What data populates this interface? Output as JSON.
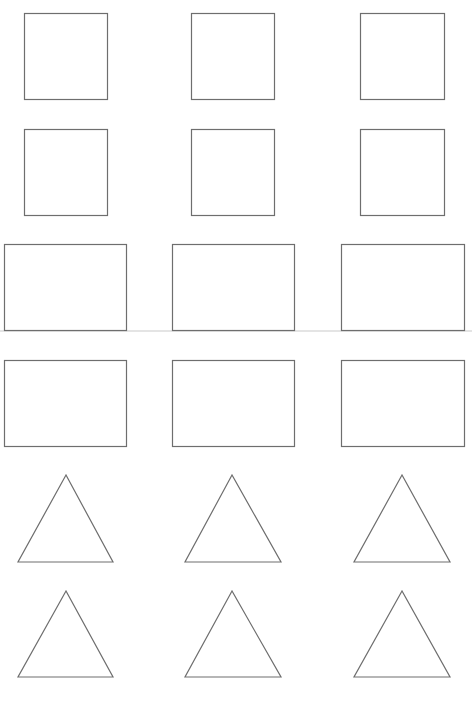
{
  "sheet": {
    "width": 472,
    "height": 701,
    "background": "#ffffff",
    "stroke_color": "#6e6e6e",
    "rows": [
      {
        "kind": "square",
        "shapes": [
          {
            "x": 24,
            "y": 13,
            "w": 83,
            "h": 86
          },
          {
            "x": 191,
            "y": 13,
            "w": 83,
            "h": 86
          },
          {
            "x": 360,
            "y": 13,
            "w": 84,
            "h": 86
          }
        ]
      },
      {
        "kind": "square",
        "shapes": [
          {
            "x": 24,
            "y": 129,
            "w": 83,
            "h": 86
          },
          {
            "x": 191,
            "y": 129,
            "w": 83,
            "h": 86
          },
          {
            "x": 360,
            "y": 129,
            "w": 84,
            "h": 86
          }
        ]
      },
      {
        "kind": "rectangle",
        "shapes": [
          {
            "x": 4,
            "y": 244,
            "w": 122,
            "h": 86
          },
          {
            "x": 172,
            "y": 244,
            "w": 122,
            "h": 86
          },
          {
            "x": 341,
            "y": 244,
            "w": 123,
            "h": 86
          }
        ]
      },
      {
        "kind": "rectangle",
        "shapes": [
          {
            "x": 4,
            "y": 360,
            "w": 122,
            "h": 86
          },
          {
            "x": 172,
            "y": 360,
            "w": 122,
            "h": 86
          },
          {
            "x": 341,
            "y": 360,
            "w": 123,
            "h": 86
          }
        ]
      },
      {
        "kind": "triangle",
        "shapes": [
          {
            "apex": [
              66,
              475
            ],
            "left": [
              18,
              562
            ],
            "right": [
              113,
              562
            ]
          },
          {
            "apex": [
              232,
              475
            ],
            "left": [
              185,
              562
            ],
            "right": [
              281,
              562
            ]
          },
          {
            "apex": [
              402,
              475
            ],
            "left": [
              354,
              562
            ],
            "right": [
              450,
              562
            ]
          }
        ]
      },
      {
        "kind": "triangle",
        "shapes": [
          {
            "apex": [
              66,
              591
            ],
            "left": [
              18,
              677
            ],
            "right": [
              113,
              677
            ]
          },
          {
            "apex": [
              232,
              591
            ],
            "left": [
              185,
              677
            ],
            "right": [
              281,
              677
            ]
          },
          {
            "apex": [
              402,
              591
            ],
            "left": [
              354,
              677
            ],
            "right": [
              450,
              677
            ]
          }
        ]
      }
    ]
  }
}
